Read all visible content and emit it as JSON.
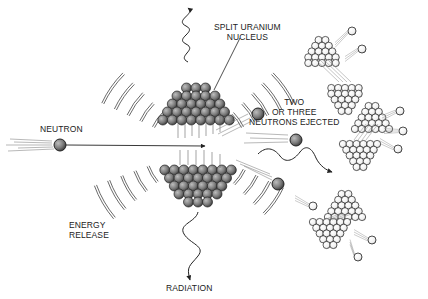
{
  "diagram": {
    "labels": {
      "split_nucleus": [
        "SPLIT URANIUM",
        "NUCLEUS"
      ],
      "neutron": "NEUTRON",
      "ejected": [
        "TWO",
        "OR THREE",
        "NEUTRONS EJECTED"
      ],
      "energy": [
        "ENERGY",
        "RELEASE"
      ],
      "radiation": "RADIATION"
    },
    "colors": {
      "ink": "#222222",
      "nucleus_dark": "#555555",
      "nucleus_shade": "#8a8a8a",
      "neutron_dark": "#5a5a5a",
      "background": "#ffffff"
    }
  }
}
